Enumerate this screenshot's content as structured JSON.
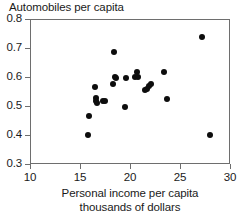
{
  "chart_data": {
    "type": "scatter",
    "title": "",
    "ylabel": "Automobiles per capita",
    "xlabel_line1": "Personal income per capita",
    "xlabel_line2": "thousands of dollars",
    "xlim": [
      10,
      30
    ],
    "ylim": [
      0.3,
      0.8
    ],
    "xticks": [
      10,
      15,
      20,
      25,
      30
    ],
    "xtick_labels": [
      "10",
      "15",
      "20",
      "25",
      "30"
    ],
    "yticks": [
      0.3,
      0.4,
      0.5,
      0.6,
      0.7,
      0.8
    ],
    "ytick_labels": [
      "0.3",
      "0.4",
      "0.5",
      "0.6",
      "0.7",
      "0.8"
    ],
    "grid": false,
    "legend": null,
    "marker_color": "#0d0d0d",
    "marker_shape": "filled-circle",
    "frame_color": "#6e6e6e",
    "points": [
      {
        "x": 15.7,
        "y": 0.405
      },
      {
        "x": 15.8,
        "y": 0.47
      },
      {
        "x": 16.4,
        "y": 0.57
      },
      {
        "x": 16.5,
        "y": 0.53
      },
      {
        "x": 16.5,
        "y": 0.52
      },
      {
        "x": 16.6,
        "y": 0.515
      },
      {
        "x": 17.2,
        "y": 0.52
      },
      {
        "x": 17.4,
        "y": 0.52
      },
      {
        "x": 18.2,
        "y": 0.58
      },
      {
        "x": 18.3,
        "y": 0.69
      },
      {
        "x": 18.4,
        "y": 0.605
      },
      {
        "x": 18.5,
        "y": 0.6
      },
      {
        "x": 19.4,
        "y": 0.5
      },
      {
        "x": 19.5,
        "y": 0.6
      },
      {
        "x": 20.4,
        "y": 0.605
      },
      {
        "x": 20.6,
        "y": 0.62
      },
      {
        "x": 20.7,
        "y": 0.605
      },
      {
        "x": 21.4,
        "y": 0.558
      },
      {
        "x": 21.6,
        "y": 0.562
      },
      {
        "x": 21.8,
        "y": 0.572
      },
      {
        "x": 22.0,
        "y": 0.578
      },
      {
        "x": 23.3,
        "y": 0.622
      },
      {
        "x": 23.6,
        "y": 0.527
      },
      {
        "x": 27.1,
        "y": 0.74
      },
      {
        "x": 27.9,
        "y": 0.405
      }
    ]
  }
}
